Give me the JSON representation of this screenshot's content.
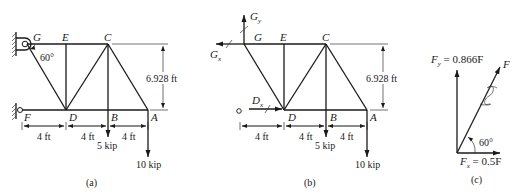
{
  "figure_a": {
    "caption": "(a)",
    "joints": {
      "G": "G",
      "E": "E",
      "C": "C",
      "F": "F",
      "D": "D",
      "B": "B",
      "A": "A"
    },
    "angle_label": "60°",
    "height_dim": "6.928 ft",
    "spans": [
      "4 ft",
      "4 ft",
      "4 ft"
    ],
    "loads": {
      "B": "5 kip",
      "A": "10 kip"
    }
  },
  "figure_b": {
    "caption": "(b)",
    "joints": {
      "G": "G",
      "E": "E",
      "C": "C",
      "D": "D",
      "B": "B",
      "A": "A"
    },
    "reactions": {
      "Gy_main": "G",
      "Gy_sub": "y",
      "Gx_main": "G",
      "Gx_sub": "x",
      "Dx_main": "D",
      "Dx_sub": "x"
    },
    "height_dim": "6.928 ft",
    "spans": [
      "4 ft",
      "4 ft",
      "4 ft"
    ],
    "loads": {
      "B": "5 kip",
      "A": "10 kip"
    }
  },
  "figure_c": {
    "caption": "(c)",
    "force_label": "F",
    "fy_main": "F",
    "fy_sub": "y",
    "fy_value": " = 0.866F",
    "fx_main": "F",
    "fx_sub": "x",
    "fx_value": " = 0.5F",
    "angle_label": "60°"
  }
}
